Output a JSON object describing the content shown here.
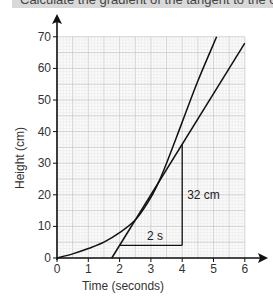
{
  "question": {
    "text": "Calculate the gradient of the tangent to the curve"
  },
  "chart_data": {
    "type": "line",
    "title": "",
    "xlabel": "Time (seconds)",
    "ylabel": "Height (cm)",
    "xlim": [
      0,
      6
    ],
    "ylim": [
      0,
      70
    ],
    "x_ticks": [
      "0",
      "1",
      "2",
      "3",
      "4",
      "5",
      "6"
    ],
    "y_ticks": [
      "0",
      "10",
      "20",
      "30",
      "40",
      "50",
      "60",
      "70"
    ],
    "grid": true,
    "series": [
      {
        "name": "curve",
        "x": [
          0,
          0.5,
          1,
          1.5,
          2,
          2.5,
          2.9,
          3.2,
          3.5,
          4,
          4.5,
          5.1
        ],
        "y": [
          0,
          1.3,
          3,
          5,
          8,
          12,
          17.5,
          23,
          30,
          43,
          56,
          70
        ]
      },
      {
        "name": "tangent",
        "x": [
          1.75,
          6
        ],
        "y": [
          0,
          68
        ]
      }
    ],
    "annotations": [
      {
        "type": "horizontal-segment",
        "x": [
          2,
          4
        ],
        "y": 4,
        "label": "2 s"
      },
      {
        "type": "vertical-segment",
        "x": 4,
        "y": [
          4,
          36
        ],
        "label": "32 cm"
      }
    ],
    "legend": "none"
  },
  "labels": {
    "run": "2 s",
    "rise": "32 cm"
  }
}
